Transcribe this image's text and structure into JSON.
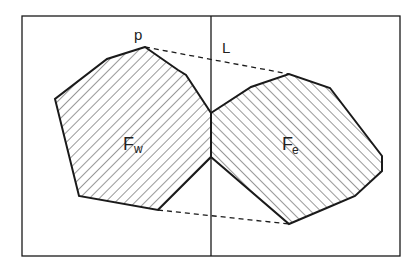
{
  "diagram": {
    "title": "",
    "labels": {
      "point_p": "p",
      "line_L": "L",
      "region_west_main": "F",
      "region_west_sub": "w",
      "region_east_main": "F",
      "region_east_sub": "e"
    },
    "frame": {
      "x1": 22,
      "y1": 16,
      "x2": 400,
      "y2": 256
    },
    "divider_line": {
      "x": 211,
      "y1": 16,
      "y2": 256
    },
    "polygon_west": [
      [
        145,
        47
      ],
      [
        107,
        59
      ],
      [
        55,
        99
      ],
      [
        79,
        196
      ],
      [
        158,
        210
      ],
      [
        211,
        157
      ],
      [
        211,
        113
      ],
      [
        186,
        75
      ],
      [
        178,
        70
      ]
    ],
    "polygon_east": [
      [
        211,
        113
      ],
      [
        211,
        157
      ],
      [
        289,
        224
      ],
      [
        329,
        207
      ],
      [
        355,
        196
      ],
      [
        382,
        171
      ],
      [
        382,
        156
      ],
      [
        330,
        88
      ],
      [
        289,
        74
      ],
      [
        251,
        87
      ]
    ],
    "upper_tangent": [
      [
        145,
        47
      ],
      [
        289,
        74
      ]
    ],
    "lower_tangent": [
      [
        158,
        210
      ],
      [
        289,
        224
      ]
    ],
    "colors": {
      "stroke": "#1a1a1a",
      "hatch": "#333333",
      "background": "#ffffff"
    }
  }
}
